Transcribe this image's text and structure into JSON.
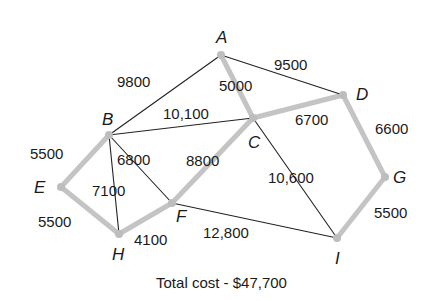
{
  "diagram": {
    "type": "minimum-spanning-tree-graph",
    "nodes": [
      {
        "id": "A",
        "x": 221,
        "y": 55,
        "lx": 216,
        "ly": 43
      },
      {
        "id": "B",
        "x": 109,
        "y": 135,
        "lx": 102,
        "ly": 125
      },
      {
        "id": "C",
        "x": 253,
        "y": 118,
        "lx": 248,
        "ly": 148
      },
      {
        "id": "D",
        "x": 343,
        "y": 95,
        "lx": 356,
        "ly": 100
      },
      {
        "id": "E",
        "x": 61,
        "y": 187,
        "lx": 34,
        "ly": 193
      },
      {
        "id": "F",
        "x": 172,
        "y": 203,
        "lx": 176,
        "ly": 222
      },
      {
        "id": "G",
        "x": 385,
        "y": 177,
        "lx": 393,
        "ly": 183
      },
      {
        "id": "H",
        "x": 119,
        "y": 234,
        "lx": 112,
        "ly": 260
      },
      {
        "id": "I",
        "x": 337,
        "y": 238,
        "lx": 335,
        "ly": 264
      }
    ],
    "edges": [
      {
        "from": "A",
        "to": "B",
        "weight": "9800",
        "selected": false,
        "lx": 117,
        "ly": 87
      },
      {
        "from": "A",
        "to": "D",
        "weight": "9500",
        "selected": false,
        "lx": 274,
        "ly": 70
      },
      {
        "from": "A",
        "to": "C",
        "weight": "5000",
        "selected": true,
        "lx": 219,
        "ly": 91
      },
      {
        "from": "B",
        "to": "C",
        "weight": "10,100",
        "selected": false,
        "lx": 163,
        "ly": 119
      },
      {
        "from": "C",
        "to": "D",
        "weight": "6700",
        "selected": true,
        "lx": 295,
        "ly": 125
      },
      {
        "from": "D",
        "to": "G",
        "weight": "6600",
        "selected": true,
        "lx": 375,
        "ly": 134
      },
      {
        "from": "C",
        "to": "F",
        "weight": "8800",
        "selected": true,
        "lx": 186,
        "ly": 166
      },
      {
        "from": "C",
        "to": "I",
        "weight": "10,600",
        "selected": false,
        "lx": 268,
        "ly": 183
      },
      {
        "from": "B",
        "to": "E",
        "weight": "5500",
        "selected": true,
        "lx": 30,
        "ly": 159
      },
      {
        "from": "B",
        "to": "F",
        "weight": "6800",
        "selected": false,
        "lx": 117,
        "ly": 165
      },
      {
        "from": "B",
        "to": "H",
        "weight": "7100",
        "selected": false,
        "lx": 92,
        "ly": 196
      },
      {
        "from": "E",
        "to": "H",
        "weight": "5500",
        "selected": true,
        "lx": 38,
        "ly": 227
      },
      {
        "from": "H",
        "to": "F",
        "weight": "4100",
        "selected": true,
        "lx": 134,
        "ly": 245
      },
      {
        "from": "F",
        "to": "I",
        "weight": "12,800",
        "selected": false,
        "lx": 203,
        "ly": 238
      },
      {
        "from": "G",
        "to": "I",
        "weight": "5500",
        "selected": true,
        "lx": 374,
        "ly": 218
      }
    ],
    "colors": {
      "selected_edge": "#c4c4c4",
      "normal_edge": "#222222",
      "node": "#bdbdbd",
      "text": "#1a1a1a"
    }
  },
  "caption": {
    "total_cost": "Total cost - $47,700"
  }
}
